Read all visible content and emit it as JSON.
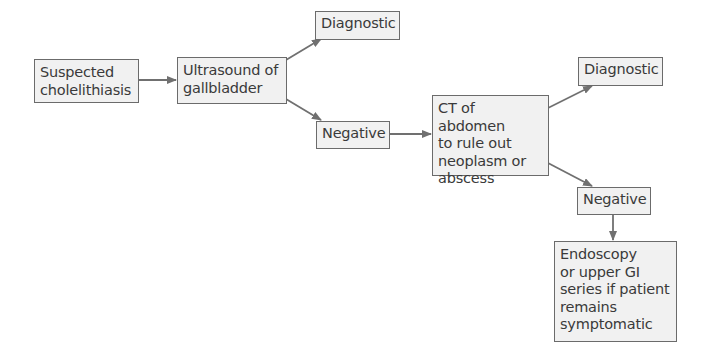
{
  "diagram": {
    "type": "flowchart",
    "colors": {
      "box_fill": "#f1f1f1",
      "border": "#6b6b6b",
      "arrow": "#707070",
      "text": "#3a3a3a"
    },
    "nodes": [
      {
        "id": "suspected",
        "label": "Suspected\ncholelithiasis"
      },
      {
        "id": "ultrasound",
        "label": "Ultrasound of\ngallbladder"
      },
      {
        "id": "diagnostic1",
        "label": "Diagnostic"
      },
      {
        "id": "negative1",
        "label": "Negative"
      },
      {
        "id": "ct",
        "label": "CT of abdomen\nto rule out\nneoplasm or\nabscess"
      },
      {
        "id": "diagnostic2",
        "label": "Diagnostic"
      },
      {
        "id": "negative2",
        "label": "Negative"
      },
      {
        "id": "endoscopy",
        "label": "Endoscopy\nor upper GI\nseries if patient\nremains\nsymptomatic"
      }
    ],
    "edges": [
      {
        "from": "suspected",
        "to": "ultrasound"
      },
      {
        "from": "ultrasound",
        "to": "diagnostic1"
      },
      {
        "from": "ultrasound",
        "to": "negative1"
      },
      {
        "from": "negative1",
        "to": "ct"
      },
      {
        "from": "ct",
        "to": "diagnostic2"
      },
      {
        "from": "ct",
        "to": "negative2"
      },
      {
        "from": "negative2",
        "to": "endoscopy"
      }
    ]
  }
}
